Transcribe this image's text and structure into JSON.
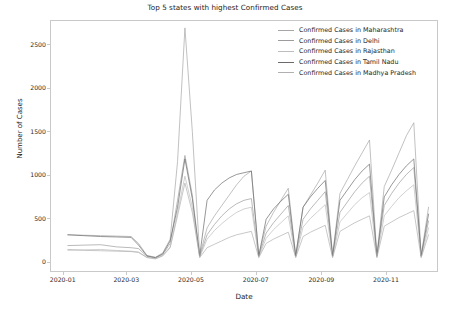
{
  "chart_data": {
    "type": "line",
    "title": "Top 5 states with highest Confirmed Cases",
    "xlabel": "Date",
    "ylabel": "Number of Cases",
    "grid": false,
    "legend_position": "upper right",
    "ylim": [
      -120,
      2780
    ],
    "yticks": [
      0,
      500,
      1000,
      1500,
      2000,
      2500
    ],
    "ytick_labels": [
      "0",
      "500",
      "1000",
      "1500",
      "2000",
      "2500"
    ],
    "xticks": [
      "2020-01",
      "2020-03",
      "2020-05",
      "2020-07",
      "2020-09",
      "2020-11"
    ],
    "xtick_labels": [
      "2020-01",
      "2020-03",
      "2020-05",
      "2020-07",
      "2020-09",
      "2020-11"
    ],
    "xlim": [
      "2019-12-20",
      "2020-12-20"
    ],
    "series": [
      {
        "name": "Confirmed Cases in Maharashtra",
        "color": "#a6a6a6",
        "x": [
          "2020-01-05",
          "2020-01-20",
          "2020-02-05",
          "2020-02-20",
          "2020-03-05",
          "2020-03-12",
          "2020-03-20",
          "2020-03-28",
          "2020-04-04",
          "2020-04-11",
          "2020-04-18",
          "2020-04-25",
          "2020-05-02",
          "2020-05-09",
          "2020-05-16",
          "2020-05-23",
          "2020-05-30",
          "2020-06-06",
          "2020-06-13",
          "2020-06-20",
          "2020-06-27",
          "2020-07-04",
          "2020-07-11",
          "2020-07-18",
          "2020-07-25",
          "2020-08-01",
          "2020-08-08",
          "2020-08-15",
          "2020-08-22",
          "2020-08-29",
          "2020-09-05",
          "2020-09-12",
          "2020-09-19",
          "2020-09-26",
          "2020-10-03",
          "2020-10-10",
          "2020-10-17",
          "2020-10-24",
          "2020-10-31",
          "2020-11-07",
          "2020-11-14",
          "2020-11-21",
          "2020-11-28",
          "2020-12-05",
          "2020-12-12"
        ],
        "y": [
          300,
          295,
          290,
          285,
          280,
          200,
          60,
          40,
          90,
          250,
          1150,
          2700,
          1500,
          60,
          380,
          520,
          640,
          760,
          880,
          980,
          1040,
          60,
          400,
          560,
          700,
          840,
          60,
          620,
          760,
          900,
          1050,
          60,
          780,
          940,
          1100,
          1250,
          1400,
          60,
          860,
          1050,
          1250,
          1450,
          1600,
          60,
          620
        ]
      },
      {
        "name": "Confirmed Cases in Delhi",
        "color": "#9c9c9c",
        "x": [
          "2020-01-05",
          "2020-01-20",
          "2020-02-05",
          "2020-02-20",
          "2020-03-05",
          "2020-03-12",
          "2020-03-20",
          "2020-03-28",
          "2020-04-04",
          "2020-04-11",
          "2020-04-18",
          "2020-04-25",
          "2020-05-02",
          "2020-05-09",
          "2020-05-16",
          "2020-05-23",
          "2020-05-30",
          "2020-06-06",
          "2020-06-13",
          "2020-06-20",
          "2020-06-27",
          "2020-07-04",
          "2020-07-11",
          "2020-07-18",
          "2020-07-25",
          "2020-08-01",
          "2020-08-08",
          "2020-08-15",
          "2020-08-22",
          "2020-08-29",
          "2020-09-05",
          "2020-09-12",
          "2020-09-19",
          "2020-09-26",
          "2020-10-03",
          "2020-10-10",
          "2020-10-17",
          "2020-10-24",
          "2020-10-31",
          "2020-11-07",
          "2020-11-14",
          "2020-11-21",
          "2020-11-28",
          "2020-12-05",
          "2020-12-12"
        ],
        "y": [
          175,
          180,
          185,
          160,
          150,
          140,
          50,
          30,
          70,
          200,
          700,
          1220,
          760,
          50,
          300,
          420,
          520,
          600,
          660,
          700,
          720,
          50,
          320,
          440,
          540,
          640,
          50,
          480,
          600,
          700,
          800,
          50,
          560,
          680,
          800,
          900,
          980,
          50,
          640,
          780,
          900,
          1000,
          1080,
          50,
          460
        ]
      },
      {
        "name": "Confirmed Cases in Rajasthan",
        "color": "#bdbdbd",
        "x": [
          "2020-01-05",
          "2020-01-20",
          "2020-02-05",
          "2020-02-20",
          "2020-03-05",
          "2020-03-12",
          "2020-03-20",
          "2020-03-28",
          "2020-04-04",
          "2020-04-11",
          "2020-04-18",
          "2020-04-25",
          "2020-05-02",
          "2020-05-09",
          "2020-05-16",
          "2020-05-23",
          "2020-05-30",
          "2020-06-06",
          "2020-06-13",
          "2020-06-20",
          "2020-06-27",
          "2020-07-04",
          "2020-07-11",
          "2020-07-18",
          "2020-07-25",
          "2020-08-01",
          "2020-08-08",
          "2020-08-15",
          "2020-08-22",
          "2020-08-29",
          "2020-09-05",
          "2020-09-12",
          "2020-09-19",
          "2020-09-26",
          "2020-10-03",
          "2020-10-10",
          "2020-10-17",
          "2020-10-24",
          "2020-10-31",
          "2020-11-07",
          "2020-11-14",
          "2020-11-21",
          "2020-11-28",
          "2020-12-05",
          "2020-12-12"
        ],
        "y": [
          120,
          125,
          130,
          118,
          110,
          100,
          40,
          25,
          60,
          160,
          560,
          980,
          620,
          40,
          250,
          350,
          430,
          500,
          560,
          600,
          620,
          40,
          260,
          360,
          440,
          520,
          40,
          390,
          490,
          570,
          650,
          40,
          450,
          550,
          650,
          730,
          790,
          40,
          520,
          630,
          730,
          810,
          880,
          40,
          380
        ]
      },
      {
        "name": "Confirmed Cases in Tamil Nadu",
        "color": "#6b6b6b",
        "x": [
          "2020-01-05",
          "2020-01-20",
          "2020-02-05",
          "2020-02-20",
          "2020-03-05",
          "2020-03-12",
          "2020-03-20",
          "2020-03-28",
          "2020-04-04",
          "2020-04-11",
          "2020-04-18",
          "2020-04-25",
          "2020-05-02",
          "2020-05-09",
          "2020-05-16",
          "2020-05-23",
          "2020-05-30",
          "2020-06-06",
          "2020-06-13",
          "2020-06-20",
          "2020-06-27",
          "2020-07-04",
          "2020-07-11",
          "2020-07-18",
          "2020-07-25",
          "2020-08-01",
          "2020-08-08",
          "2020-08-15",
          "2020-08-22",
          "2020-08-29",
          "2020-09-05",
          "2020-09-12",
          "2020-09-19",
          "2020-09-26",
          "2020-10-03",
          "2020-10-10",
          "2020-10-17",
          "2020-10-24",
          "2020-10-31",
          "2020-11-07",
          "2020-11-14",
          "2020-11-21",
          "2020-11-28",
          "2020-12-05",
          "2020-12-12"
        ],
        "y": [
          300,
          290,
          280,
          275,
          270,
          180,
          55,
          35,
          80,
          230,
          620,
          1180,
          720,
          55,
          700,
          820,
          900,
          960,
          1000,
          1020,
          1040,
          55,
          480,
          600,
          690,
          770,
          55,
          620,
          740,
          840,
          930,
          55,
          700,
          820,
          940,
          1040,
          1120,
          55,
          740,
          880,
          1000,
          1100,
          1180,
          55,
          540
        ]
      },
      {
        "name": "Confirmed Cases in Madhya Pradesh",
        "color": "#b0b0b0",
        "x": [
          "2020-01-05",
          "2020-01-20",
          "2020-02-05",
          "2020-02-20",
          "2020-03-05",
          "2020-03-12",
          "2020-03-20",
          "2020-03-28",
          "2020-04-04",
          "2020-04-11",
          "2020-04-18",
          "2020-04-25",
          "2020-05-02",
          "2020-05-09",
          "2020-05-16",
          "2020-05-23",
          "2020-05-30",
          "2020-06-06",
          "2020-06-13",
          "2020-06-20",
          "2020-06-27",
          "2020-07-04",
          "2020-07-11",
          "2020-07-18",
          "2020-07-25",
          "2020-08-01",
          "2020-08-08",
          "2020-08-15",
          "2020-08-22",
          "2020-08-29",
          "2020-09-05",
          "2020-09-12",
          "2020-09-19",
          "2020-09-26",
          "2020-10-03",
          "2020-10-10",
          "2020-10-17",
          "2020-10-24",
          "2020-10-31",
          "2020-11-07",
          "2020-11-14",
          "2020-11-21",
          "2020-11-28",
          "2020-12-05",
          "2020-12-12"
        ],
        "y": [
          130,
          120,
          115,
          110,
          105,
          95,
          35,
          20,
          55,
          150,
          520,
          900,
          560,
          35,
          150,
          190,
          230,
          270,
          300,
          320,
          340,
          35,
          200,
          250,
          290,
          330,
          35,
          280,
          330,
          370,
          410,
          35,
          340,
          390,
          440,
          480,
          520,
          35,
          400,
          450,
          500,
          540,
          580,
          35,
          300
        ]
      }
    ]
  },
  "legend": {
    "items": [
      {
        "label": "Confirmed Cases in Maharashtra"
      },
      {
        "label": "Confirmed Cases in Delhi"
      },
      {
        "label": "Confirmed Cases in Rajasthan"
      },
      {
        "label": "Confirmed Cases in Tamil Nadu"
      },
      {
        "label": "Confirmed Cases in Madhya Pradesh"
      }
    ]
  }
}
